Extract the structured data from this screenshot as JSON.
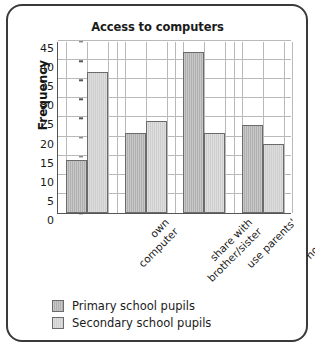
{
  "chart_data": {
    "type": "bar",
    "title": "Access to computers",
    "xlabel": "",
    "ylabel": "Frequency",
    "ylim": [
      0,
      45
    ],
    "ytick_step": 5,
    "yticks": [
      0,
      5,
      10,
      15,
      20,
      25,
      30,
      35,
      40,
      45
    ],
    "grid": true,
    "legend_position": "bottom-left",
    "categories": [
      "own\ncomputer",
      "share with\nbrother/sister",
      "use parents'",
      "no access"
    ],
    "series": [
      {
        "name": "Primary school pupils",
        "color": "#b0b0b0",
        "values": [
          14,
          21,
          42,
          23
        ]
      },
      {
        "name": "Secondary school pupils",
        "color": "#cecece",
        "values": [
          37,
          24,
          21,
          18
        ]
      }
    ]
  },
  "frame": {
    "border_color": "#3a3a3a"
  }
}
